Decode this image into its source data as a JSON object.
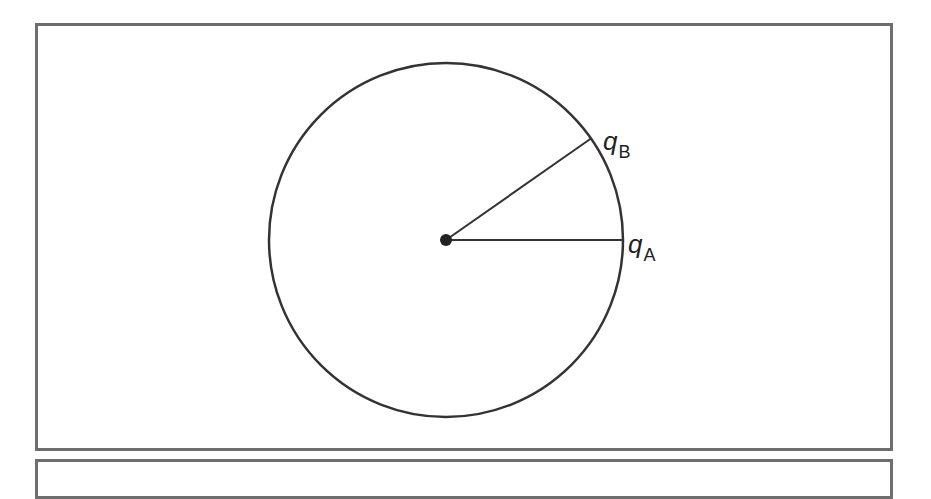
{
  "figure": {
    "type": "circle-with-radii",
    "center": {
      "x": 446,
      "y": 240
    },
    "radius": 177,
    "colors": {
      "stroke": "#333333",
      "frame": "#6e6e6e",
      "background": "#ffffff"
    },
    "points": [
      {
        "id": "A",
        "symbol": "q",
        "subscript": "A",
        "angle_deg": 0
      },
      {
        "id": "B",
        "symbol": "q",
        "subscript": "B",
        "angle_deg": 35
      }
    ]
  }
}
